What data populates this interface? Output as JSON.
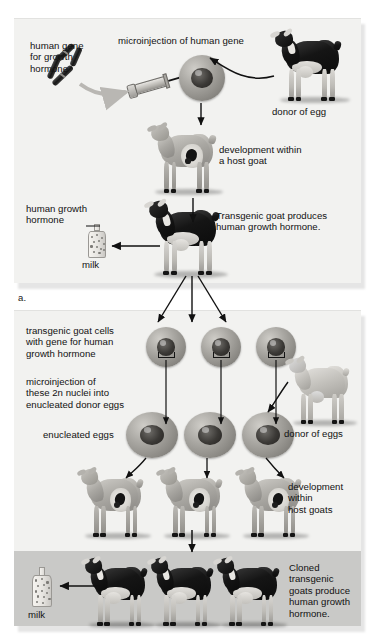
{
  "figure": {
    "domain": "biology-diagram",
    "color_mode": "grayscale",
    "panel_background": "#f2f2f0",
    "band_background": "#c9c9c7",
    "text_color": "#111111"
  },
  "panel_a": {
    "label": "a.",
    "labels": {
      "human_gene": "human gene\nfor growth\nhormone",
      "microinjection": "microinjection of human gene",
      "donor_of_egg": "donor of egg",
      "development_host": "development within\na host goat",
      "human_growth_hormone": "human growth\nhormone",
      "milk": "milk",
      "transgenic_produces": "Transgenic goat produces\nhuman growth hormone."
    },
    "figures": [
      {
        "name": "chromosome-with-human-gene",
        "kind": "chromosome"
      },
      {
        "name": "syringe-microinjection",
        "kind": "syringe"
      },
      {
        "name": "egg-cell-being-injected",
        "kind": "egg"
      },
      {
        "name": "donor-goat-dark",
        "kind": "goat",
        "coat": "dark"
      },
      {
        "name": "host-goat-pregnant",
        "kind": "goat",
        "coat": "mid",
        "fetus": true
      },
      {
        "name": "transgenic-goat-adult",
        "kind": "goat",
        "coat": "dark"
      },
      {
        "name": "milk-bottle",
        "kind": "bottle"
      }
    ]
  },
  "panel_b": {
    "label": "b.",
    "labels": {
      "transgenic_cells": "transgenic goat cells\nwith gene for human\ngrowth hormone",
      "microinjection_nuclei": "microinjection of\nthese 2n nuclei into\nenucleated donor eggs",
      "enucleated_eggs": "enucleated eggs",
      "donor_of_eggs": "donor of eggs",
      "development_host_goats": "development\nwithin\nhost goats",
      "cloned_transgenic": "Cloned\ntransgenic\ngoats produce\nhuman growth\nhormone.",
      "milk": "milk"
    },
    "counts": {
      "transgenic_cells": 3,
      "enucleated_eggs": 3,
      "host_goats": 3,
      "cloned_goats": 3
    },
    "figures": [
      {
        "name": "transgenic-cell",
        "kind": "egg",
        "repeat": 3
      },
      {
        "name": "enucleated-egg",
        "kind": "egg",
        "repeat": 3
      },
      {
        "name": "donor-goat-eggs-light",
        "kind": "goat",
        "coat": "light"
      },
      {
        "name": "host-goat-pregnant",
        "kind": "goat",
        "coat": "mid",
        "fetus": true,
        "repeat": 3
      },
      {
        "name": "cloned-transgenic-goat",
        "kind": "goat",
        "coat": "dark",
        "repeat": 3
      },
      {
        "name": "milk-bottle",
        "kind": "bottle"
      }
    ]
  }
}
